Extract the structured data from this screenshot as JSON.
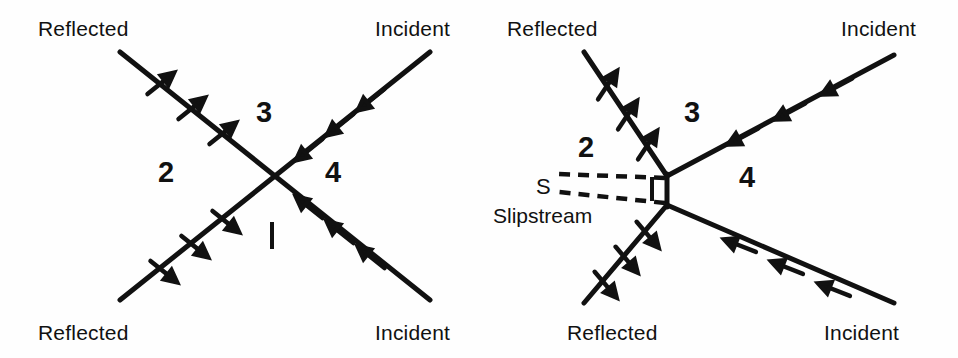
{
  "figure": {
    "type": "shock-interaction-diagram",
    "ink_color": "#111111",
    "background_color": "#fefefe",
    "panel_count": 2
  },
  "panels": [
    {
      "id": "regular-reflection",
      "labels": {
        "top_left": "Reflected",
        "top_right": "Incident",
        "bottom_left": "Reflected",
        "bottom_right": "Incident"
      },
      "regions": {
        "top": "3",
        "left": "2",
        "right": "4",
        "bottom": "1"
      },
      "shocks": [
        {
          "name": "incident-upper-right",
          "label": "Incident",
          "arrow_count": 3,
          "arrow_direction": "down-left"
        },
        {
          "name": "incident-lower-right",
          "label": "Incident",
          "arrow_count": 3,
          "arrow_direction": "up-left"
        },
        {
          "name": "reflected-upper-left",
          "label": "Reflected",
          "arrow_count": 3,
          "arrow_direction": "up-right"
        },
        {
          "name": "reflected-lower-left",
          "label": "Reflected",
          "arrow_count": 3,
          "arrow_direction": "down-right"
        }
      ]
    },
    {
      "id": "mach-reflection",
      "labels": {
        "top_left": "Reflected",
        "top_right": "Incident",
        "bottom_left": "Reflected",
        "bottom_right": "Incident",
        "slipstream_symbol": "S",
        "slipstream_name": "Slipstream"
      },
      "regions": {
        "top": "3",
        "left": "2",
        "right": "4",
        "stem": "1"
      },
      "shocks": [
        {
          "name": "incident-upper-right",
          "label": "Incident",
          "arrow_count": 3,
          "arrow_direction": "down-left"
        },
        {
          "name": "incident-lower-right",
          "label": "Incident",
          "arrow_count": 3,
          "arrow_direction": "up-left"
        },
        {
          "name": "reflected-upper-left",
          "label": "Reflected",
          "arrow_count": 3,
          "arrow_direction": "up-right"
        },
        {
          "name": "reflected-lower-left",
          "label": "Reflected",
          "arrow_count": 3,
          "arrow_direction": "down-right"
        }
      ],
      "mach_stem": {
        "present": true,
        "orientation": "vertical",
        "region_label": "1"
      },
      "slipstreams": {
        "count": 2,
        "style": "dashed",
        "symbol": "S"
      }
    }
  ]
}
